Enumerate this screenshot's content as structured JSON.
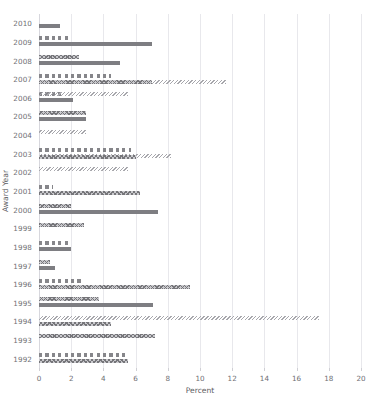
{
  "chart_data": {
    "type": "bar",
    "orientation": "horizontal",
    "title": "",
    "xlabel": "Percent",
    "ylabel": "Award Year",
    "xlim": [
      0,
      20
    ],
    "xticks": [
      0,
      2,
      4,
      6,
      8,
      10,
      12,
      14,
      16,
      18,
      20
    ],
    "grid": "vertical",
    "legend": "none",
    "categories": [
      "2010",
      "2009",
      "2008",
      "2007",
      "2006",
      "2005",
      "2004",
      "2003",
      "2002",
      "2001",
      "2000",
      "1999",
      "1998",
      "1997",
      "1996",
      "1995",
      "1994",
      "1993",
      "1992"
    ],
    "series": [
      {
        "name": "Series A",
        "pattern": "dashed",
        "values": [
          null,
          1.8,
          null,
          4.5,
          1.5,
          null,
          null,
          5.7,
          null,
          0.9,
          null,
          null,
          1.9,
          null,
          2.8,
          null,
          null,
          null,
          5.5
        ]
      },
      {
        "name": "Series B",
        "pattern": "hatch-dense",
        "values": [
          null,
          null,
          2.5,
          7.0,
          2.1,
          2.9,
          null,
          6.0,
          null,
          6.3,
          2.0,
          2.8,
          null,
          0.7,
          9.4,
          3.7,
          4.5,
          7.2,
          5.5
        ]
      },
      {
        "name": "Series C",
        "pattern": "hatch-light",
        "values": [
          null,
          null,
          null,
          11.6,
          5.5,
          null,
          2.9,
          8.2,
          5.5,
          null,
          null,
          null,
          null,
          null,
          null,
          null,
          17.4,
          null,
          null
        ]
      },
      {
        "name": "Series D",
        "pattern": "solid",
        "values": [
          1.3,
          7.0,
          5.0,
          null,
          null,
          null,
          null,
          null,
          null,
          null,
          7.4,
          null,
          2.0,
          1.0,
          null,
          7.1,
          null,
          null,
          null
        ]
      }
    ],
    "bars": [
      {
        "year": "2010",
        "row": 0,
        "items": [
          {
            "value": 1.3,
            "pattern": "solid",
            "offset": 1
          }
        ]
      },
      {
        "year": "2009",
        "row": 1,
        "items": [
          {
            "value": 1.8,
            "pattern": "dashed",
            "offset": 0
          },
          {
            "value": 7.0,
            "pattern": "solid",
            "offset": 1
          }
        ]
      },
      {
        "year": "2008",
        "row": 2,
        "items": [
          {
            "value": 2.5,
            "pattern": "hatch-dense",
            "offset": 0
          },
          {
            "value": 5.0,
            "pattern": "solid",
            "offset": 1
          }
        ]
      },
      {
        "year": "2007",
        "row": 3,
        "items": [
          {
            "value": 4.5,
            "pattern": "dashed",
            "offset": 0
          },
          {
            "value": 11.6,
            "pattern": "hatch-light",
            "offset": 1
          },
          {
            "value": 7.0,
            "pattern": "hatch-dense",
            "offset": 1
          }
        ]
      },
      {
        "year": "2006",
        "row": 4,
        "items": [
          {
            "value": 1.5,
            "pattern": "dashed",
            "offset": 0
          },
          {
            "value": 5.5,
            "pattern": "hatch-light",
            "offset": 0
          },
          {
            "value": 2.1,
            "pattern": "solid",
            "offset": 1
          }
        ]
      },
      {
        "year": "2005",
        "row": 5,
        "items": [
          {
            "value": 2.9,
            "pattern": "hatch-dense",
            "offset": 0
          },
          {
            "value": 2.9,
            "pattern": "solid",
            "offset": 1
          }
        ]
      },
      {
        "year": "2004",
        "row": 6,
        "items": [
          {
            "value": 2.9,
            "pattern": "hatch-light",
            "offset": 0
          }
        ]
      },
      {
        "year": "2003",
        "row": 7,
        "items": [
          {
            "value": 5.7,
            "pattern": "dashed",
            "offset": 0
          },
          {
            "value": 8.2,
            "pattern": "hatch-light",
            "offset": 1
          },
          {
            "value": 6.0,
            "pattern": "hatch-dense",
            "offset": 1
          }
        ]
      },
      {
        "year": "2002",
        "row": 8,
        "items": [
          {
            "value": 5.5,
            "pattern": "hatch-light",
            "offset": 0
          }
        ]
      },
      {
        "year": "2001",
        "row": 9,
        "items": [
          {
            "value": 0.9,
            "pattern": "dashed",
            "offset": 0
          },
          {
            "value": 6.3,
            "pattern": "hatch-dense",
            "offset": 1
          }
        ]
      },
      {
        "year": "2000",
        "row": 10,
        "items": [
          {
            "value": 2.0,
            "pattern": "hatch-dense",
            "offset": 0
          },
          {
            "value": 7.4,
            "pattern": "solid",
            "offset": 1
          }
        ]
      },
      {
        "year": "1999",
        "row": 11,
        "items": [
          {
            "value": 2.8,
            "pattern": "hatch-dense",
            "offset": 0
          }
        ]
      },
      {
        "year": "1998",
        "row": 12,
        "items": [
          {
            "value": 1.9,
            "pattern": "dashed",
            "offset": 0
          },
          {
            "value": 2.0,
            "pattern": "solid",
            "offset": 1
          }
        ]
      },
      {
        "year": "1997",
        "row": 13,
        "items": [
          {
            "value": 0.7,
            "pattern": "hatch-dense",
            "offset": 0
          },
          {
            "value": 1.0,
            "pattern": "solid",
            "offset": 1
          }
        ]
      },
      {
        "year": "1996",
        "row": 14,
        "items": [
          {
            "value": 2.8,
            "pattern": "dashed",
            "offset": 0
          },
          {
            "value": 9.4,
            "pattern": "hatch-dense",
            "offset": 1
          }
        ]
      },
      {
        "year": "1995",
        "row": 15,
        "items": [
          {
            "value": 3.7,
            "pattern": "hatch-dense",
            "offset": 0
          },
          {
            "value": 7.1,
            "pattern": "solid",
            "offset": 1
          }
        ]
      },
      {
        "year": "1994",
        "row": 16,
        "items": [
          {
            "value": 17.4,
            "pattern": "hatch-light",
            "offset": 0
          },
          {
            "value": 4.5,
            "pattern": "hatch-dense",
            "offset": 1
          }
        ]
      },
      {
        "year": "1993",
        "row": 17,
        "items": [
          {
            "value": 7.2,
            "pattern": "hatch-dense",
            "offset": 0
          }
        ]
      },
      {
        "year": "1992",
        "row": 18,
        "items": [
          {
            "value": 5.5,
            "pattern": "dashed",
            "offset": 0
          },
          {
            "value": 5.5,
            "pattern": "hatch-dense",
            "offset": 1
          }
        ]
      }
    ],
    "colors": {
      "bar_dark": "#7e7e82",
      "bar_mid": "#8a8a8e",
      "bar_light": "#a7a7ac",
      "gridline": "#e8e8ec",
      "axis_text": "#6f6f74",
      "title_text": "#5d5d62",
      "background": "#ffffff"
    }
  }
}
